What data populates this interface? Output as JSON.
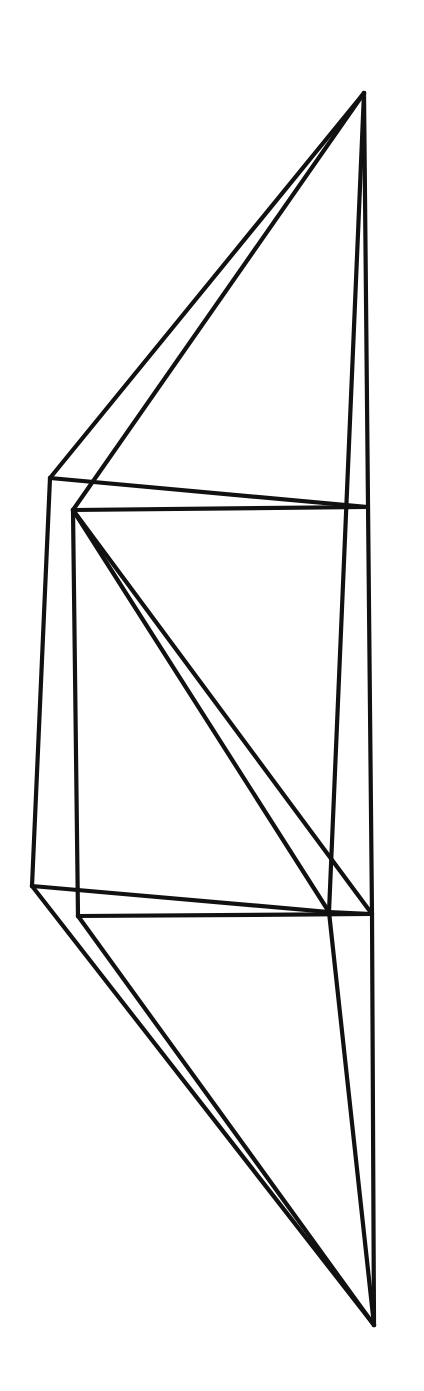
{
  "diagram": {
    "type": "wireframe-polyhedron",
    "stroke_color": "#111111",
    "background": "#ffffff",
    "vertices": {
      "T": [
        364,
        93
      ],
      "A": [
        50,
        478
      ],
      "B": [
        73,
        510
      ],
      "H": [
        368,
        507
      ],
      "C": [
        32,
        886
      ],
      "D": [
        78,
        916
      ],
      "E": [
        329,
        912
      ],
      "F": [
        372,
        914
      ],
      "G": [
        374,
        1325
      ]
    },
    "edges": [
      [
        "T",
        "A"
      ],
      [
        "T",
        "B"
      ],
      [
        "T",
        "E"
      ],
      [
        "T",
        "F"
      ],
      [
        "A",
        "H"
      ],
      [
        "B",
        "H"
      ],
      [
        "A",
        "C"
      ],
      [
        "B",
        "D"
      ],
      [
        "B",
        "E"
      ],
      [
        "B",
        "F"
      ],
      [
        "C",
        "E"
      ],
      [
        "D",
        "F"
      ],
      [
        "E",
        "F"
      ],
      [
        "C",
        "G"
      ],
      [
        "D",
        "G"
      ],
      [
        "E",
        "G"
      ],
      [
        "F",
        "G"
      ]
    ]
  }
}
